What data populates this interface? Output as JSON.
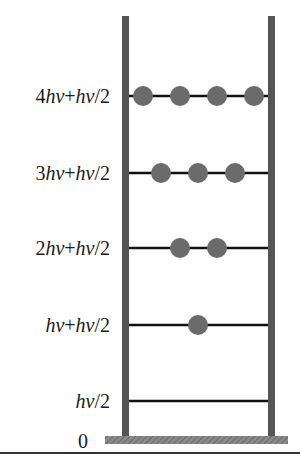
{
  "diagram": {
    "type": "energy-level-ladder",
    "colors": {
      "rail": "#555555",
      "level_line": "#111111",
      "particle": "#6b6b6b",
      "base": "#7a7a7a",
      "label": "#1a1a1a",
      "rule": "#333333"
    },
    "zero_label": "0",
    "levels": [
      {
        "label_parts": [
          {
            "t": "4"
          },
          {
            "t": "hν",
            "i": true
          },
          {
            "t": "+"
          },
          {
            "t": "hν",
            "i": true
          },
          {
            "t": "/2"
          }
        ],
        "label_text": "4hν+hν/2",
        "y": 96,
        "particles_x": [
          143,
          180,
          217,
          254
        ]
      },
      {
        "label_parts": [
          {
            "t": "3"
          },
          {
            "t": "hν",
            "i": true
          },
          {
            "t": "+"
          },
          {
            "t": "hν",
            "i": true
          },
          {
            "t": "/2"
          }
        ],
        "label_text": "3hν+hν/2",
        "y": 173,
        "particles_x": [
          161,
          198,
          235
        ]
      },
      {
        "label_parts": [
          {
            "t": "2"
          },
          {
            "t": "hν",
            "i": true
          },
          {
            "t": "+"
          },
          {
            "t": "hν",
            "i": true
          },
          {
            "t": "/2"
          }
        ],
        "label_text": "2hν+hν/2",
        "y": 248,
        "particles_x": [
          180,
          217
        ]
      },
      {
        "label_parts": [
          {
            "t": "hν",
            "i": true
          },
          {
            "t": "+"
          },
          {
            "t": "hν",
            "i": true
          },
          {
            "t": "/2"
          }
        ],
        "label_text": "hν+hν/2",
        "y": 325,
        "particles_x": [
          198
        ]
      },
      {
        "label_parts": [
          {
            "t": "hν",
            "i": true
          },
          {
            "t": "/2"
          }
        ],
        "label_text": "hν/2",
        "y": 401,
        "particles_x": []
      }
    ]
  }
}
